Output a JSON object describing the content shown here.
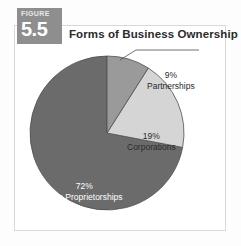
{
  "figure": {
    "badge_word": "FIGURE",
    "badge_number": "5.5",
    "title": "Forms of Business Ownership"
  },
  "colors": {
    "badge_bg": "#8e8e8e",
    "box_border": "#d8d8d6",
    "page_bg": "#fdfdfd",
    "slice_sole": "#6b6b6b",
    "slice_corporations": "#d5d5d5",
    "slice_partnerships": "#9a9a9a",
    "slice_outline": "#4f4f4f",
    "leader_line": "#4f4f4f",
    "title_text": "#2b2b2b",
    "label_dark": "#2b2b2b",
    "label_light": "#ffffff"
  },
  "labels": {
    "partnerships": {
      "pct": "9%",
      "name": "Partnerships"
    },
    "corporations": {
      "pct": "19%",
      "name": "Corporations"
    },
    "sole": {
      "pct": "72%",
      "name": "Sole Proprietorships"
    }
  },
  "chart_data": {
    "type": "pie",
    "title": "Forms of Business Ownership",
    "subtitle": "",
    "xlabel": "",
    "ylabel": "",
    "legend": "none",
    "grid": false,
    "start_angle_deg": 0,
    "direction": "clockwise",
    "units": "percent",
    "categories": [
      "Partnerships",
      "Corporations",
      "Sole Proprietorships"
    ],
    "values": [
      9,
      19,
      72
    ],
    "value_labels": [
      "9%",
      "19%",
      "72%"
    ],
    "colors": [
      "#9a9a9a",
      "#d5d5d5",
      "#6b6b6b"
    ],
    "label_placement": [
      "outside-with-leader",
      "inside",
      "inside"
    ],
    "total": 100
  }
}
